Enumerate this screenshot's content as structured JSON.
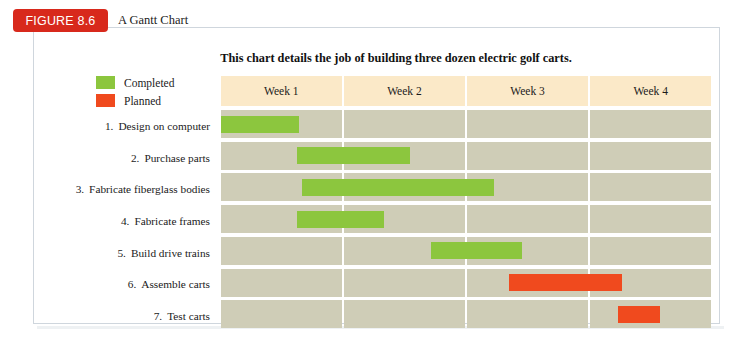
{
  "figure": {
    "tag_label": "FIGURE 8.6",
    "caption": "A Gantt Chart",
    "tag_color": "#d8291c"
  },
  "chart_title": "This chart details the job of building three dozen electric golf carts.",
  "legend": {
    "items": [
      {
        "label": "Completed",
        "color": "#8cc63e",
        "swatch_name": "legend-swatch-completed"
      },
      {
        "label": "Planned",
        "color": "#f04a1e",
        "swatch_name": "legend-swatch-planned"
      }
    ]
  },
  "colors": {
    "completed": "#8cc63e",
    "planned": "#f04a1e",
    "header_band": "#fbe9c8",
    "grid_cell": "#cfcdb7",
    "frame_border": "#cfd6dd",
    "page_background": "#ffffff"
  },
  "chart_data": {
    "type": "bar",
    "subtype": "gantt",
    "title": "This chart details the job of building three dozen electric golf carts.",
    "xlabel": "",
    "ylabel": "",
    "xlim": [
      0,
      4
    ],
    "grid": true,
    "legend_position": "top-left",
    "columns": [
      "Week 1",
      "Week 2",
      "Week 3",
      "Week 4"
    ],
    "categories": [
      "1. Design on computer",
      "2. Purchase parts",
      "3. Fabricate fiberglass bodies",
      "4. Fabricate frames",
      "5. Build drive trains",
      "6. Assemble carts",
      "7. Test carts"
    ],
    "series": [
      {
        "name": "Completed",
        "color": "#8cc63e"
      },
      {
        "name": "Planned",
        "color": "#f04a1e"
      }
    ],
    "tasks": [
      {
        "num": "1.",
        "label": "Design on computer",
        "start": 0.0,
        "end": 0.65,
        "status": "Completed"
      },
      {
        "num": "2.",
        "label": "Purchase parts",
        "start": 0.63,
        "end": 1.55,
        "status": "Completed"
      },
      {
        "num": "3.",
        "label": "Fabricate fiberglass bodies",
        "start": 0.67,
        "end": 2.22,
        "status": "Completed"
      },
      {
        "num": "4.",
        "label": "Fabricate frames",
        "start": 0.63,
        "end": 1.33,
        "status": "Completed"
      },
      {
        "num": "5.",
        "label": "Build drive trains",
        "start": 1.72,
        "end": 2.45,
        "status": "Completed"
      },
      {
        "num": "6.",
        "label": "Assemble carts",
        "start": 2.35,
        "end": 3.26,
        "status": "Planned"
      },
      {
        "num": "7.",
        "label": "Test carts",
        "start": 3.23,
        "end": 3.58,
        "status": "Planned"
      }
    ]
  }
}
